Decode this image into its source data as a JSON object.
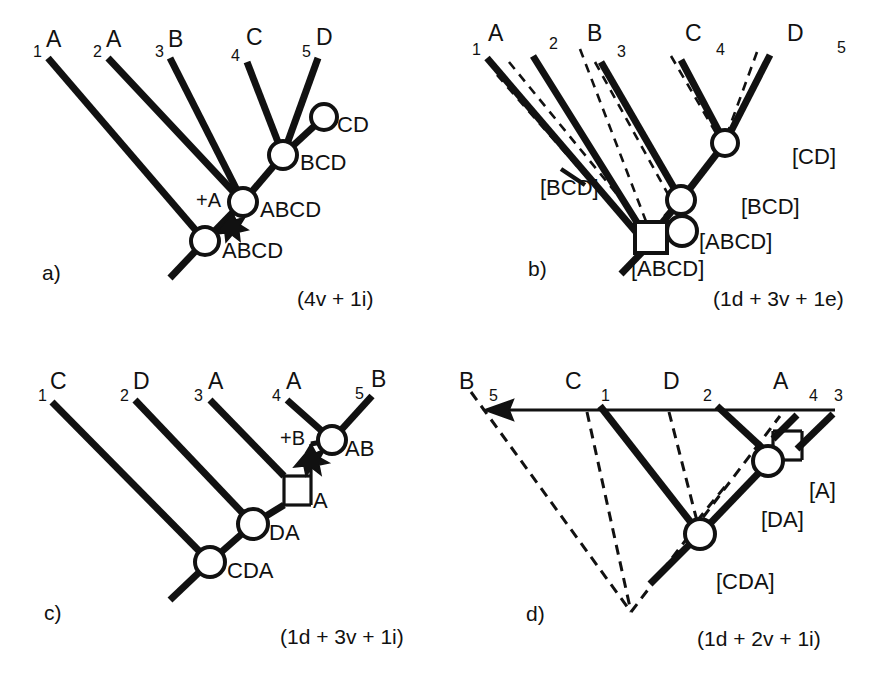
{
  "figure": {
    "background_color": "#ffffff",
    "ink_color": "#111111",
    "panel_count": 4
  },
  "panels": [
    {
      "id": "a",
      "letter": "a)",
      "cost": "(4v + 1i)",
      "has_ghost_tree": false,
      "tips": [
        {
          "num": "1",
          "taxon": "A"
        },
        {
          "num": "2",
          "taxon": "A"
        },
        {
          "num": "3",
          "taxon": "B"
        },
        {
          "num": "4",
          "taxon": "C"
        },
        {
          "num": "5",
          "taxon": "D"
        }
      ],
      "nodes": [
        {
          "label": "CD",
          "shape": "circle"
        },
        {
          "label": "BCD",
          "shape": "circle"
        },
        {
          "label": "ABCD",
          "shape": "circle"
        },
        {
          "label": "ABCD",
          "shape": "circle"
        }
      ],
      "gain_marks": [
        {
          "label": "+A",
          "glyph": "star-burst"
        }
      ]
    },
    {
      "id": "b",
      "letter": "b)",
      "cost": "(1d + 3v + 1e)",
      "has_ghost_tree": true,
      "tips": [
        {
          "num": "1",
          "taxon": "A"
        },
        {
          "num": "2",
          "taxon": ""
        },
        {
          "num": "3",
          "taxon": "B"
        },
        {
          "num": "4",
          "taxon": "C"
        },
        {
          "num": "5",
          "taxon": "D"
        }
      ],
      "taxon_headers": [
        "A",
        "B",
        "C",
        "D"
      ],
      "nodes": [
        {
          "label": "[CD]",
          "shape": "circle"
        },
        {
          "label": "[BCD]",
          "shape": "circle"
        },
        {
          "label": "[ABCD]",
          "shape": "circle"
        },
        {
          "label": "[ABCD]",
          "shape": "square"
        }
      ],
      "branch_annotations": [
        {
          "label": "[BCD]",
          "glyph": "extinction-tick"
        }
      ]
    },
    {
      "id": "c",
      "letter": "c)",
      "cost": "(1d + 3v + 1i)",
      "has_ghost_tree": false,
      "tips": [
        {
          "num": "1",
          "taxon": "C"
        },
        {
          "num": "2",
          "taxon": "D"
        },
        {
          "num": "3",
          "taxon": "A"
        },
        {
          "num": "4",
          "taxon": "A"
        },
        {
          "num": "5",
          "taxon": "B"
        }
      ],
      "nodes": [
        {
          "label": "AB",
          "shape": "circle"
        },
        {
          "label": "A",
          "shape": "square"
        },
        {
          "label": "DA",
          "shape": "circle"
        },
        {
          "label": "CDA",
          "shape": "circle"
        }
      ],
      "gain_marks": [
        {
          "label": "+B",
          "glyph": "star-burst"
        }
      ]
    },
    {
      "id": "d",
      "letter": "d)",
      "cost": "(1d + 2v + 1i)",
      "has_ghost_tree": true,
      "has_time_axis_arrow": true,
      "tips": [
        {
          "num": "5",
          "taxon": "B"
        },
        {
          "num": "1",
          "taxon": "C"
        },
        {
          "num": "2",
          "taxon": "D"
        },
        {
          "num": "4",
          "taxon": "A"
        },
        {
          "num": "3",
          "taxon": ""
        }
      ],
      "taxon_headers": [
        "B",
        "C",
        "D",
        "A"
      ],
      "nodes": [
        {
          "label": "[A]",
          "shape": "square"
        },
        {
          "label": "[DA]",
          "shape": "circle"
        },
        {
          "label": "[CDA]",
          "shape": "circle"
        }
      ]
    }
  ]
}
